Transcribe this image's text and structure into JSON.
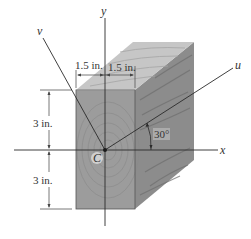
{
  "figure": {
    "type": "cross-section-diagram",
    "colors": {
      "front_face": "#9c9c9c",
      "top_face": "#c6c6c6",
      "side_face": "#8c8c8c",
      "grain": "#6e6e6e",
      "line": "#2a2a2a",
      "dimension_line": "#555555",
      "label_bg": "#d8d8d8"
    },
    "axes": {
      "x_label": "x",
      "y_label": "y",
      "u_label": "u",
      "v_label": "v",
      "centroid_label": "C"
    },
    "dimensions": {
      "top_left_width": "1.5 in.",
      "top_right_width": "1.5 in.",
      "upper_height": "3 in.",
      "lower_height": "3 in."
    },
    "angle": {
      "label": "30°",
      "between": [
        "x",
        "u"
      ],
      "degrees": 30
    }
  }
}
